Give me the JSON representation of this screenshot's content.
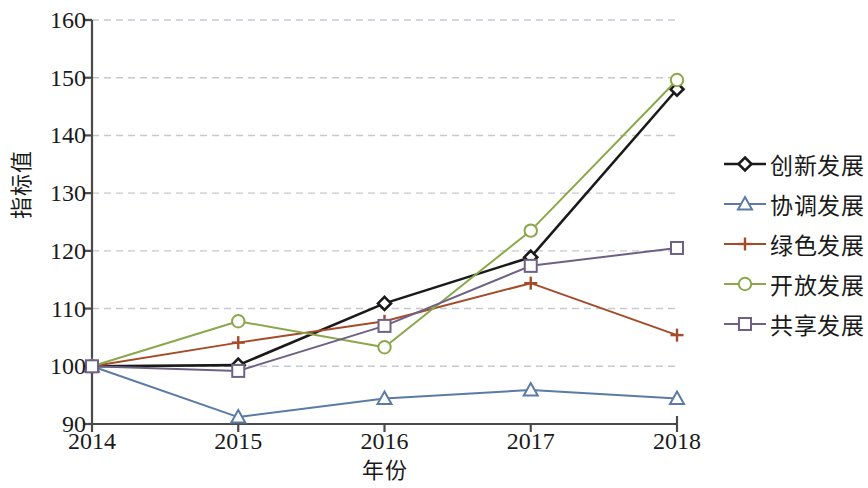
{
  "chart_data": {
    "type": "line",
    "title": "",
    "xlabel": "年份",
    "ylabel": "指标值",
    "categories": [
      "2014",
      "2015",
      "2016",
      "2017",
      "2018"
    ],
    "x": [
      2014,
      2015,
      2016,
      2017,
      2018
    ],
    "xlim": [
      2014,
      2018
    ],
    "ylim": [
      90,
      160
    ],
    "yticks": [
      90,
      100,
      110,
      120,
      130,
      140,
      150,
      160
    ],
    "ytick_labels": [
      "90",
      "100",
      "110",
      "120",
      "130",
      "140",
      "150",
      "160"
    ],
    "grid": "horizontal-dashed",
    "legend_position": "right",
    "series": [
      {
        "name": "创新发展",
        "marker": "diamond",
        "color": "#1a1a1a",
        "values": [
          100.0,
          100.2,
          110.9,
          118.9,
          148.0
        ]
      },
      {
        "name": "协调发展",
        "marker": "triangle",
        "color": "#5b7ba6",
        "values": [
          100.0,
          91.2,
          94.4,
          95.9,
          94.4
        ]
      },
      {
        "name": "绿色发展",
        "marker": "plus",
        "color": "#a64b2a",
        "values": [
          100.0,
          104.1,
          107.8,
          114.4,
          105.4
        ]
      },
      {
        "name": "开放发展",
        "marker": "circle",
        "color": "#8aa84b",
        "values": [
          100.0,
          107.8,
          103.3,
          123.5,
          149.6
        ]
      },
      {
        "name": "共享发展",
        "marker": "square",
        "color": "#6e6185",
        "values": [
          100.0,
          99.2,
          107.0,
          117.4,
          120.5
        ]
      }
    ]
  },
  "axis": {
    "y_title": "指标值",
    "x_title": "年份"
  },
  "colors": {
    "axis": "#4a4a4a",
    "grid": "#c8c8d2",
    "text": "#1a1a1a"
  }
}
